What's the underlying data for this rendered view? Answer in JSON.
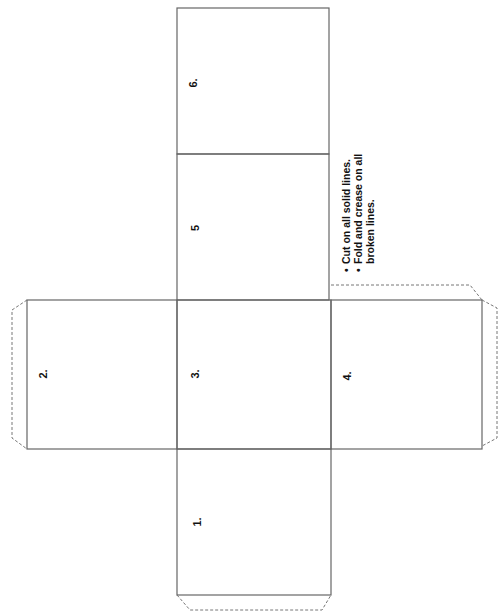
{
  "diagram": {
    "type": "cube-net",
    "faces": [
      {
        "id": "1",
        "label": "1."
      },
      {
        "id": "2",
        "label": "2."
      },
      {
        "id": "3",
        "label": "3."
      },
      {
        "id": "4",
        "label": "4."
      },
      {
        "id": "5",
        "label": "5"
      },
      {
        "id": "6",
        "label": "6."
      }
    ],
    "instructions": [
      "Cut on all solid lines.",
      "Fold and crease on all broken lines."
    ],
    "colors": {
      "solid_line": "#666666",
      "dashed_line": "#777777",
      "text": "#111111",
      "background": "#ffffff"
    }
  }
}
